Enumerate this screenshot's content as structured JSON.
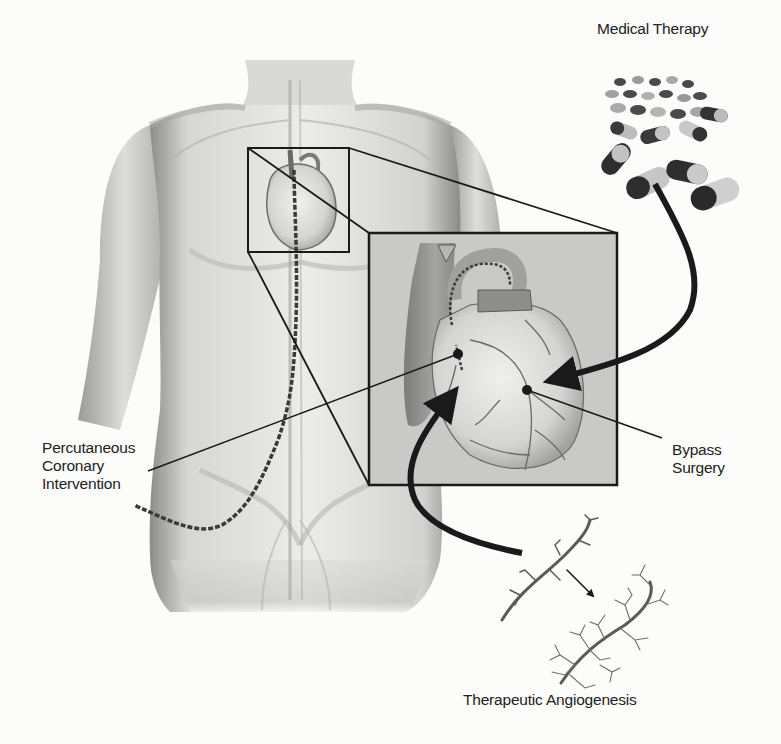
{
  "diagram": {
    "colors": {
      "background": "#fcfcfb",
      "skin_light": "#e6e6e4",
      "skin_shadow": "#9a9a98",
      "inset_fill": "#c9c9c7",
      "heart_fill": "#dcdcda",
      "aorta_fill": "#8e8e8c",
      "line": "#1a1a1a",
      "capsule_dark": "#3a3a3a",
      "capsule_light": "#c8c8c8"
    },
    "nodes": [
      {
        "id": "medical",
        "label": "Medical Therapy",
        "icon": "pills-icon"
      },
      {
        "id": "pci",
        "label_lines": [
          "Percutaneous",
          "Coronary",
          "Intervention"
        ],
        "icon": "catheter-icon"
      },
      {
        "id": "bypass",
        "label_lines": [
          "Bypass",
          "Surgery"
        ],
        "icon": "graft-dot-icon"
      },
      {
        "id": "angio",
        "label": "Therapeutic Angiogenesis",
        "icon": "vessel-branch-icon"
      }
    ],
    "regions": {
      "body": "human-torso-illustration",
      "zoom_source_box": {
        "x": 248,
        "y": 148,
        "w": 101,
        "h": 104
      },
      "zoom_inset_box": {
        "x": 369,
        "y": 233,
        "w": 248,
        "h": 252
      }
    },
    "edges": [
      {
        "from": "medical",
        "to": "heart-inset",
        "style": "thick-arrow"
      },
      {
        "from": "angio",
        "to": "heart-inset",
        "style": "thick-arrow"
      },
      {
        "from": "pci",
        "to": "heart-inset-dot-left",
        "style": "leader-line"
      },
      {
        "from": "bypass",
        "to": "heart-inset-dot-right",
        "style": "leader-line"
      }
    ]
  }
}
